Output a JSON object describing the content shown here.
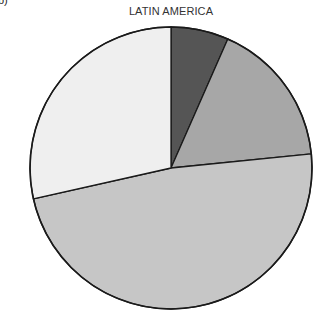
{
  "panel_label": "b)",
  "chart_data": {
    "type": "pie",
    "title": "LATIN AMERICA",
    "start_angle_deg": 0,
    "direction": "clockwise",
    "legend": "none",
    "slices": [
      {
        "label": "",
        "value": 6.6,
        "color": "#555555"
      },
      {
        "label": "",
        "value": 16.8,
        "color": "#a7a7a7"
      },
      {
        "label": "",
        "value": 48.1,
        "color": "#c6c6c6"
      },
      {
        "label": "",
        "value": 28.5,
        "color": "#efefef"
      }
    ],
    "center": [
      171,
      168
    ],
    "radius": 141,
    "stroke": "#1a1a1a"
  }
}
